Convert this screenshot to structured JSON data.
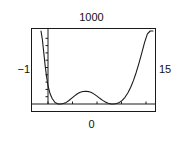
{
  "figure": {
    "name": "polynomial-plot",
    "frame_color": "#1a1a1a",
    "curve_color": "#1a1a1a",
    "background": "#ffffff"
  },
  "labels": {
    "top": "1000",
    "bottom": "0",
    "left": "−1",
    "right": "15"
  },
  "chart_data": {
    "type": "line",
    "title": "1000",
    "xlabel": "0",
    "ylabel": "−1",
    "y2label": "15",
    "xlim": [
      -1,
      15
    ],
    "ylim": [
      0,
      1000
    ],
    "grid": false,
    "legend": null,
    "axes": {
      "x_axis_line_y": 0,
      "y_axis_line_x": 0,
      "x_ticks": [
        0,
        3.5,
        7,
        10.5,
        14
      ],
      "y_ticks": [
        100,
        200,
        300,
        400,
        500,
        600,
        700,
        800,
        900
      ]
    },
    "series": [
      {
        "name": "f(x)",
        "x": [
          -1.0,
          -0.8,
          -0.6,
          -0.4,
          -0.2,
          0.0,
          0.3,
          0.6,
          1.0,
          1.4,
          1.8,
          2.2,
          2.6,
          3.0,
          3.4,
          3.8,
          4.2,
          4.6,
          5.0,
          5.4,
          5.8,
          6.2,
          6.6,
          7.0,
          7.4,
          7.8,
          8.2,
          8.6,
          9.0,
          9.4,
          9.8,
          10.2,
          10.6,
          11.0,
          11.4,
          11.8,
          12.2,
          12.6,
          13.0,
          13.4,
          13.8,
          14.2,
          14.6,
          15.0
        ],
        "y": [
          1000,
          880,
          700,
          520,
          370,
          250,
          140,
          75,
          20,
          2,
          0,
          6,
          22,
          48,
          80,
          112,
          140,
          160,
          172,
          175,
          170,
          157,
          135,
          108,
          78,
          50,
          27,
          10,
          1,
          0,
          6,
          22,
          50,
          92,
          150,
          226,
          320,
          432,
          560,
          700,
          845,
          960,
          1000,
          1000
        ]
      }
    ],
    "annotations": [
      {
        "text": "W-shaped sextic-like curve with two minima touching the x-axis and a central local maximum"
      }
    ]
  }
}
